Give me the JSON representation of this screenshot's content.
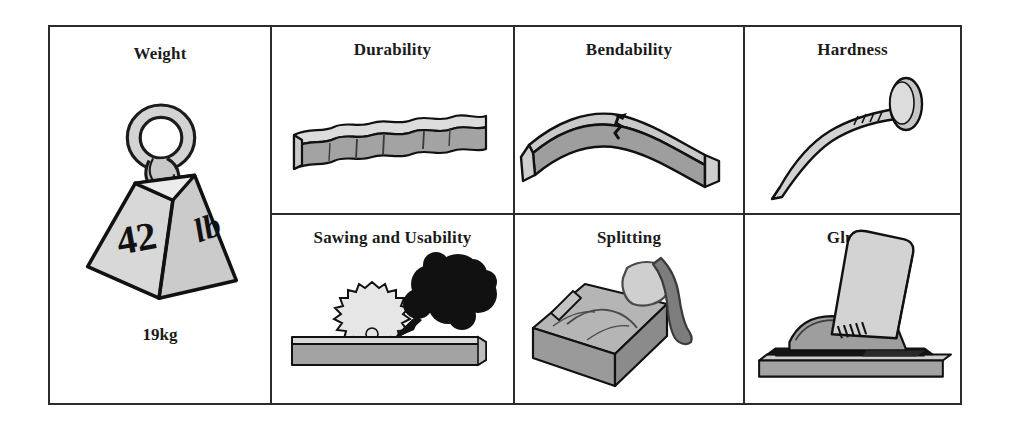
{
  "figure": {
    "name": "wood-properties-panel-grid",
    "panels": [
      {
        "id": "weight",
        "title": "Weight",
        "caption": "19kg",
        "icon": "weight-kettlebell-icon",
        "labels": {
          "number": "42",
          "unit": "lb"
        }
      },
      {
        "id": "durability",
        "title": "Durability",
        "caption": "",
        "icon": "weathered-plank-icon"
      },
      {
        "id": "bendability",
        "title": "Bendability",
        "caption": "",
        "icon": "bent-beam-icon"
      },
      {
        "id": "hardness",
        "title": "Hardness",
        "caption": "",
        "icon": "bent-nail-icon"
      },
      {
        "id": "sawing",
        "title": "Sawing and Usability",
        "caption": "",
        "icon": "circular-saw-blade-smoke-icon"
      },
      {
        "id": "splitting",
        "title": "Splitting",
        "caption": "",
        "icon": "axe-and-log-icon"
      },
      {
        "id": "gluing",
        "title": "Gluing",
        "caption": "",
        "icon": "glued-boards-icon"
      }
    ]
  },
  "colors": {
    "ink": "#2b2b2b",
    "paper": "#ffffff",
    "gray_mid": "#a3a3a3",
    "gray_light": "#cfcfcf",
    "gray_lighter": "#e0e0e0",
    "gray_dark": "#8a8a8a",
    "black": "#111111"
  }
}
